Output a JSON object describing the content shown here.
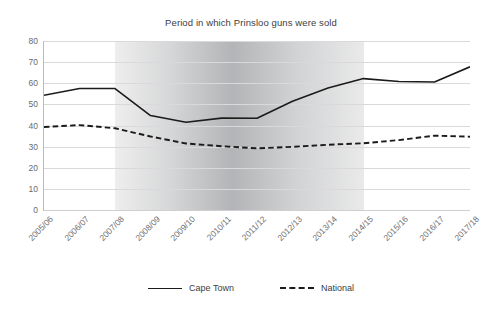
{
  "chart_data": {
    "type": "line",
    "title": "Period in which Prinsloo guns were sold",
    "xlabel": "",
    "ylabel": "",
    "ylim": [
      0,
      80
    ],
    "yticks": [
      0,
      10,
      20,
      30,
      40,
      50,
      60,
      70,
      80
    ],
    "grid": true,
    "legend_position": "bottom",
    "categories": [
      "2005/06",
      "2006/07",
      "2007/08",
      "2008/09",
      "2009/10",
      "2010/11",
      "2011/12",
      "2012/13",
      "2013/14",
      "2014/15",
      "2015/16",
      "2016/17",
      "2017/18"
    ],
    "series": [
      {
        "name": "Cape Town",
        "style": "solid",
        "color": "#1b1b1b",
        "values": [
          54.3,
          57.5,
          57.5,
          44.7,
          41.5,
          43.5,
          43.4,
          51.5,
          57.8,
          62.2,
          60.8,
          60.6,
          67.8
        ]
      },
      {
        "name": "National",
        "style": "dashed",
        "color": "#1b1b1b",
        "values": [
          39.3,
          40.2,
          38.7,
          34.8,
          31.5,
          30.2,
          29.2,
          29.9,
          30.9,
          31.6,
          33.1,
          35.2,
          34.7
        ]
      }
    ],
    "annotations": [
      {
        "type": "shaded-band",
        "label": "Period in which Prinsloo guns were sold",
        "from_category": "2007/08",
        "to_category": "2014/15",
        "color": "#787a7e"
      }
    ]
  },
  "legend": {
    "items": [
      {
        "label": "Cape Town",
        "style": "solid"
      },
      {
        "label": "National",
        "style": "dashed"
      }
    ]
  }
}
